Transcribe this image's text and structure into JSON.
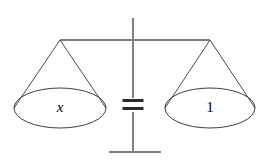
{
  "figure": {
    "name": "balance-scale-equation",
    "background_color": "#ffffff"
  },
  "colors": {
    "structure_line": "#808080",
    "pan_line": "#4a4a4a",
    "pan_outline": "#3c3c3c",
    "equals_sign": "#2b2b2b",
    "label_text": "#000000"
  },
  "scale": {
    "post": {
      "label": "vertical-post",
      "x": 133,
      "y_top": 18,
      "y_bottom": 152
    },
    "beam": {
      "label": "horizontal-beam",
      "y": 40,
      "x_left": 60,
      "x_right": 210
    },
    "base": {
      "label": "base-line",
      "y": 152,
      "x_left": 109,
      "x_right": 161
    }
  },
  "equals_sign": {
    "symbol": "=",
    "x_center": 133,
    "y_center": 104,
    "bar_width": 21,
    "bar_height": 3,
    "bar_gap": 5
  },
  "pans": [
    {
      "id": "left-pan",
      "side": "left",
      "label": "x",
      "label_style": "italic",
      "apex_x": 60,
      "apex_y": 40,
      "ellipse_cx": 60,
      "ellipse_cy": 108,
      "ellipse_rx": 46,
      "ellipse_ry": 20,
      "label_x": 60,
      "label_y": 108
    },
    {
      "id": "right-pan",
      "side": "right",
      "label": "1",
      "label_style": "upright",
      "apex_x": 210,
      "apex_y": 40,
      "ellipse_cx": 210,
      "ellipse_cy": 108,
      "ellipse_rx": 45,
      "ellipse_ry": 20,
      "label_x": 210,
      "label_y": 108
    }
  ],
  "meaning": {
    "expression": "x = 1",
    "left_operand": "x",
    "operator": "=",
    "right_operand": "1"
  }
}
